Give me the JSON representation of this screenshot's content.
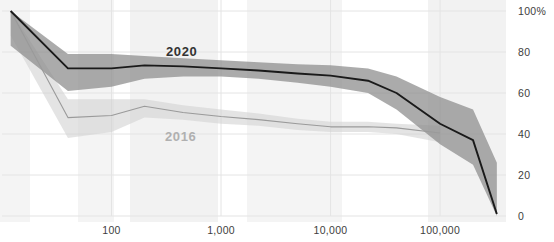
{
  "chart_data": {
    "type": "line",
    "title": "",
    "subtitle": "",
    "xlabel": "",
    "ylabel": "",
    "xscale": "log",
    "xlim": [
      10,
      400000
    ],
    "ylim": [
      0,
      100
    ],
    "grid": true,
    "legend_position": "inline-annotation",
    "x_tick_labels": [
      "100",
      "1,000",
      "10,000",
      "100,000"
    ],
    "x_tick_values": [
      100,
      1000,
      10000,
      100000
    ],
    "y_tick_labels": [
      "100%",
      "80",
      "60",
      "40",
      "20",
      "0"
    ],
    "y_tick_values": [
      100,
      80,
      60,
      40,
      20,
      0
    ],
    "series": [
      {
        "name": "2020",
        "color": "#1a1a1a",
        "band_color": "#8a8a8a",
        "label_color": "#333333",
        "x": [
          12,
          40,
          100,
          200,
          450,
          1000,
          2200,
          5000,
          10000,
          22000,
          40000,
          100000,
          200000,
          330000
        ],
        "values": [
          100,
          72,
          72,
          73.5,
          73,
          72,
          71,
          69.5,
          68.5,
          66,
          60,
          45,
          37,
          1
        ],
        "band_upper": [
          100,
          79,
          79,
          78,
          77,
          76,
          75,
          74,
          73.5,
          72,
          68,
          58,
          52,
          26
        ],
        "band_lower": [
          83,
          61,
          63,
          67,
          68,
          68,
          67,
          65,
          63,
          60,
          52,
          35,
          25,
          0
        ]
      },
      {
        "name": "2016",
        "color": "#9a9a9a",
        "band_color": "#d2d2d2",
        "label_color": "#b0b0b0",
        "x": [
          12,
          40,
          100,
          200,
          450,
          1000,
          2200,
          5000,
          10000,
          22000,
          40000,
          100000
        ],
        "values": [
          100,
          48,
          49,
          53.5,
          50.5,
          48.5,
          47,
          45,
          43.5,
          43.5,
          43,
          40.5
        ],
        "band_upper": [
          100,
          57,
          57,
          57,
          54,
          52,
          50,
          47.5,
          46,
          46,
          45,
          44
        ],
        "band_lower": [
          88,
          38,
          41,
          48,
          47,
          45,
          44,
          42,
          41,
          41,
          40,
          36
        ]
      }
    ],
    "annotations": [
      {
        "text": "2020",
        "x_px": 166,
        "y_px": 44,
        "color": "#333333"
      },
      {
        "text": "2016",
        "x_px": 165,
        "y_px": 129,
        "color": "#b0b0b0"
      }
    ],
    "background_bands": [
      {
        "x_start_px": 0,
        "width_px": 30,
        "color": "#f4f4f4"
      },
      {
        "x_start_px": 78,
        "width_px": 36,
        "color": "#f4f4f4"
      },
      {
        "x_start_px": 130,
        "width_px": 88,
        "color": "#f2f2f2"
      },
      {
        "x_start_px": 247,
        "width_px": 95,
        "color": "#f4f4f4"
      },
      {
        "x_start_px": 428,
        "width_px": 78,
        "color": "#f2f2f2"
      }
    ],
    "colors": {
      "grid": "#e4e4e4",
      "axis_text": "#3d3d3d",
      "series_2020": "#1a1a1a",
      "series_2016": "#9a9a9a",
      "band_2020": "#8a8a8a",
      "band_2016": "#d2d2d2",
      "background": "#ffffff"
    }
  }
}
